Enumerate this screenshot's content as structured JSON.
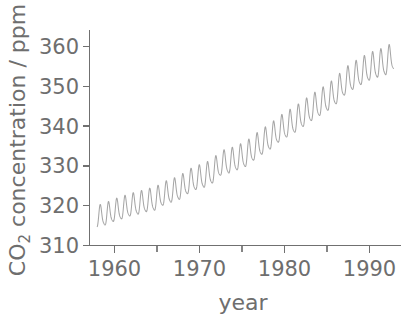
{
  "chart_data": {
    "type": "line",
    "title": "",
    "subtitle": "",
    "xlabel": "year",
    "ylabel_prefix": "CO",
    "ylabel_sub": "2",
    "ylabel_suffix": " concentration / ppm",
    "ylabel_full": "CO2 concentration / ppm",
    "xlim": [
      1957.0,
      1994.8
    ],
    "ylim": [
      308.0,
      366.0
    ],
    "xticks": [
      1960,
      1970,
      1980,
      1990
    ],
    "xticklabels": [
      "1960",
      "1970",
      "1980",
      "1990"
    ],
    "xticks_minor": [
      1965,
      1975,
      1985
    ],
    "yticks": [
      310,
      320,
      330,
      340,
      350,
      360
    ],
    "yticklabels": [
      "310",
      "320",
      "330",
      "340",
      "350",
      "360"
    ],
    "grid": false,
    "legend": "none",
    "line_color": "#a6a6a6",
    "axis_color": "#707070",
    "text_color": "#6e6e6e",
    "background_color": "#ffffff",
    "series": [
      {
        "name": "Mauna Loa monthly mean CO2",
        "description": "Keeling curve: monthly mean atmospheric CO2 concentration showing rising trend with seasonal oscillation of about 6 ppm peak-to-peak",
        "x": [
          1958.0,
          1958.08,
          1958.17,
          1958.25,
          1958.33,
          1958.42,
          1958.5,
          1958.58,
          1958.67,
          1958.75,
          1958.83,
          1958.92,
          1959.0,
          1959.08,
          1959.17,
          1959.25,
          1959.33,
          1959.42,
          1959.5,
          1959.58,
          1959.67,
          1959.75,
          1959.83,
          1959.92,
          1960.0,
          1960.08,
          1960.17,
          1960.25,
          1960.33,
          1960.42,
          1960.5,
          1960.58,
          1960.67,
          1960.75,
          1960.83,
          1960.92,
          1961.0,
          1961.25,
          1961.5,
          1961.75,
          1962.0,
          1962.25,
          1962.5,
          1962.75,
          1963.0,
          1963.25,
          1963.5,
          1963.75,
          1964.0,
          1964.25,
          1964.5,
          1964.75,
          1965.0,
          1965.25,
          1965.5,
          1965.75,
          1966.0,
          1966.25,
          1966.5,
          1966.75,
          1967.0,
          1967.25,
          1967.5,
          1967.75,
          1968.0,
          1968.25,
          1968.5,
          1968.75,
          1969.0,
          1969.25,
          1969.5,
          1969.75,
          1970.0,
          1970.25,
          1970.5,
          1970.75,
          1971.0,
          1971.25,
          1971.5,
          1971.75,
          1972.0,
          1972.25,
          1972.5,
          1972.75,
          1973.0,
          1973.25,
          1973.5,
          1973.75,
          1974.0,
          1974.25,
          1974.5,
          1974.75,
          1975.0,
          1975.25,
          1975.5,
          1975.75,
          1976.0,
          1976.25,
          1976.5,
          1976.75,
          1977.0,
          1977.25,
          1977.5,
          1977.75,
          1978.0,
          1978.25,
          1978.5,
          1978.75,
          1979.0,
          1979.25,
          1979.5,
          1979.75,
          1980.0,
          1980.25,
          1980.5,
          1980.75,
          1981.0,
          1981.25,
          1981.5,
          1981.75,
          1982.0,
          1982.25,
          1982.5,
          1982.75,
          1983.0,
          1983.25,
          1983.5,
          1983.75,
          1984.0,
          1984.25,
          1984.5,
          1984.75,
          1985.0,
          1985.25,
          1985.5,
          1985.75,
          1986.0,
          1986.25,
          1986.5,
          1986.75,
          1987.0,
          1987.25,
          1987.5,
          1987.75,
          1988.0,
          1988.25,
          1988.5,
          1988.75,
          1989.0,
          1989.25,
          1989.5,
          1989.75,
          1990.0,
          1990.25,
          1990.5,
          1990.75,
          1991.0,
          1991.25,
          1991.5,
          1991.75,
          1992.0,
          1992.25,
          1992.5,
          1992.75,
          1993.0,
          1993.25,
          1993.5,
          1993.75,
          1994.0,
          1994.25
        ],
        "annual_mean_x": [
          1958,
          1959,
          1960,
          1961,
          1962,
          1963,
          1964,
          1965,
          1966,
          1967,
          1968,
          1969,
          1970,
          1971,
          1972,
          1973,
          1974,
          1975,
          1976,
          1977,
          1978,
          1979,
          1980,
          1981,
          1982,
          1983,
          1984,
          1985,
          1986,
          1987,
          1988,
          1989,
          1990,
          1991,
          1992,
          1993,
          1994
        ],
        "annual_mean_y": [
          315.3,
          315.9,
          316.9,
          317.6,
          318.4,
          318.9,
          319.6,
          320.0,
          321.4,
          322.2,
          323.0,
          324.6,
          325.7,
          326.3,
          327.5,
          329.7,
          330.2,
          331.1,
          332.0,
          333.8,
          335.4,
          336.8,
          338.7,
          340.1,
          341.4,
          343.0,
          344.6,
          346.0,
          347.4,
          349.2,
          351.6,
          353.1,
          354.4,
          355.6,
          356.4,
          357.1,
          358.8
        ]
      }
    ]
  },
  "figure": {
    "geometry": {
      "plot_left": 89,
      "plot_right": 401,
      "plot_top": 30,
      "plot_bottom": 245,
      "px_per_year": 8.5,
      "px_per_ppm": 3.98
    },
    "ylabel_position": "left-rotated",
    "xlabel_position": "below-axis"
  }
}
